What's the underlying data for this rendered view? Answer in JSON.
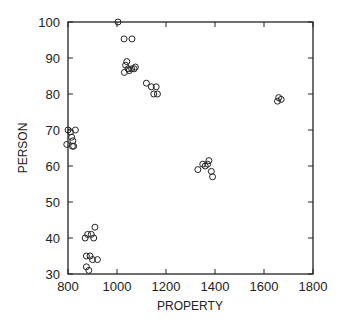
{
  "chart_data": {
    "type": "scatter",
    "title": "",
    "xlabel": "PROPERTY",
    "ylabel": "PERSON",
    "xlim": [
      800,
      1800
    ],
    "ylim": [
      30,
      100
    ],
    "grid": false,
    "legend": null,
    "marker": "open-circle",
    "x_ticks": [
      800,
      1000,
      1200,
      1400,
      1600,
      1800
    ],
    "y_ticks": [
      30,
      40,
      50,
      60,
      70,
      80,
      90,
      100
    ],
    "points": [
      {
        "x": 1004,
        "y": 100
      },
      {
        "x": 1029,
        "y": 95.3
      },
      {
        "x": 1061,
        "y": 95.3
      },
      {
        "x": 1030,
        "y": 86
      },
      {
        "x": 1035,
        "y": 88
      },
      {
        "x": 1040,
        "y": 89
      },
      {
        "x": 1045,
        "y": 87
      },
      {
        "x": 1050,
        "y": 86.5
      },
      {
        "x": 1060,
        "y": 87
      },
      {
        "x": 1070,
        "y": 87
      },
      {
        "x": 1075,
        "y": 87.5
      },
      {
        "x": 1120,
        "y": 83
      },
      {
        "x": 1140,
        "y": 82
      },
      {
        "x": 1160,
        "y": 82
      },
      {
        "x": 1150,
        "y": 80
      },
      {
        "x": 1165,
        "y": 80
      },
      {
        "x": 800,
        "y": 70
      },
      {
        "x": 810,
        "y": 69.5
      },
      {
        "x": 830,
        "y": 70
      },
      {
        "x": 815,
        "y": 68
      },
      {
        "x": 820,
        "y": 67
      },
      {
        "x": 795,
        "y": 66
      },
      {
        "x": 818,
        "y": 65.5
      },
      {
        "x": 823,
        "y": 65.5
      },
      {
        "x": 910,
        "y": 43
      },
      {
        "x": 880,
        "y": 41
      },
      {
        "x": 895,
        "y": 41
      },
      {
        "x": 905,
        "y": 40
      },
      {
        "x": 870,
        "y": 40
      },
      {
        "x": 875,
        "y": 35
      },
      {
        "x": 890,
        "y": 35
      },
      {
        "x": 900,
        "y": 34
      },
      {
        "x": 920,
        "y": 34
      },
      {
        "x": 875,
        "y": 32
      },
      {
        "x": 885,
        "y": 31
      },
      {
        "x": 1330,
        "y": 59
      },
      {
        "x": 1350,
        "y": 60.5
      },
      {
        "x": 1360,
        "y": 60
      },
      {
        "x": 1370,
        "y": 60.5
      },
      {
        "x": 1375,
        "y": 61.5
      },
      {
        "x": 1385,
        "y": 58.5
      },
      {
        "x": 1390,
        "y": 57
      },
      {
        "x": 1655,
        "y": 78
      },
      {
        "x": 1660,
        "y": 79
      },
      {
        "x": 1670,
        "y": 78.5
      }
    ]
  },
  "labels": {
    "xlabel": "PROPERTY",
    "ylabel": "PERSON"
  }
}
